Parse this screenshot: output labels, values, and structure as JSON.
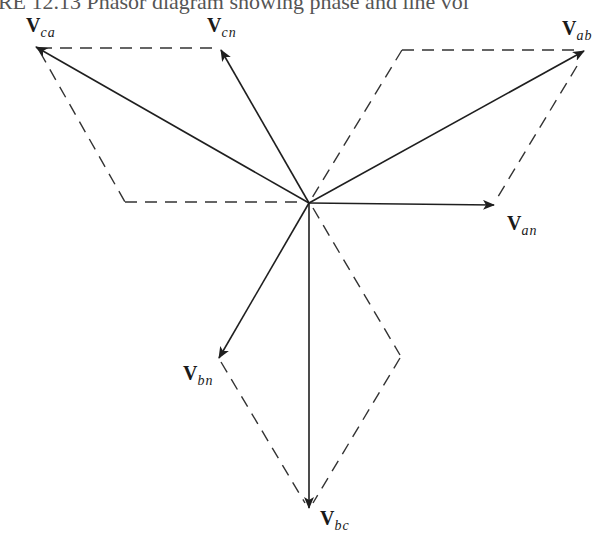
{
  "caption": "URE 12.13 Phasor diagram showing phase and line vol",
  "origin": [
    309,
    203
  ],
  "phasors": [
    {
      "id": "V_an",
      "main": "V",
      "sub": "an",
      "kind": "phase",
      "tip": [
        494,
        205
      ],
      "label_pos": [
        507,
        212
      ]
    },
    {
      "id": "V_bn",
      "main": "V",
      "sub": "bn",
      "kind": "phase",
      "tip": [
        219,
        358
      ],
      "label_pos": [
        183,
        362
      ]
    },
    {
      "id": "V_cn",
      "main": "V",
      "sub": "cn",
      "kind": "phase",
      "tip": [
        221,
        50
      ],
      "label_pos": [
        207,
        14
      ]
    },
    {
      "id": "V_ab",
      "main": "V",
      "sub": "ab",
      "kind": "line",
      "tip": [
        584,
        51
      ],
      "label_pos": [
        562,
        17
      ]
    },
    {
      "id": "V_bc",
      "main": "V",
      "sub": "bc",
      "kind": "line",
      "tip": [
        309,
        508
      ],
      "label_pos": [
        320,
        507
      ]
    },
    {
      "id": "V_ca",
      "main": "V",
      "sub": "ca",
      "kind": "line",
      "tip": [
        36,
        47
      ],
      "label_pos": [
        26,
        14
      ]
    }
  ],
  "dashed_segments": [
    [
      [
        40,
        48
      ],
      [
        218,
        48
      ]
    ],
    [
      [
        40,
        52
      ],
      [
        125,
        202
      ]
    ],
    [
      [
        125,
        202
      ],
      [
        305,
        202
      ]
    ],
    [
      [
        402,
        50
      ],
      [
        580,
        50
      ]
    ],
    [
      [
        402,
        50
      ],
      [
        312,
        198
      ]
    ],
    [
      [
        577,
        66
      ],
      [
        496,
        200
      ]
    ],
    [
      [
        313,
        208
      ],
      [
        400,
        355
      ]
    ],
    [
      [
        400,
        358
      ],
      [
        313,
        503
      ]
    ],
    [
      [
        221,
        362
      ],
      [
        305,
        503
      ]
    ]
  ],
  "colors": {
    "line": "#1f1f1f",
    "dash": "#333333"
  }
}
